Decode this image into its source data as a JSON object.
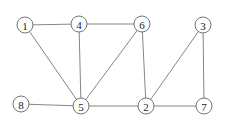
{
  "graph": {
    "nodes": [
      {
        "id": "1",
        "label": "1",
        "x": 25,
        "y": 25
      },
      {
        "id": "4",
        "label": "4",
        "x": 79,
        "y": 24
      },
      {
        "id": "6",
        "label": "6",
        "x": 142,
        "y": 24
      },
      {
        "id": "3",
        "label": "3",
        "x": 203,
        "y": 25
      },
      {
        "id": "8",
        "label": "8",
        "x": 21,
        "y": 104
      },
      {
        "id": "5",
        "label": "5",
        "x": 81,
        "y": 106
      },
      {
        "id": "2",
        "label": "2",
        "x": 146,
        "y": 106
      },
      {
        "id": "7",
        "label": "7",
        "x": 204,
        "y": 106
      }
    ],
    "edges": [
      [
        "1",
        "4"
      ],
      [
        "4",
        "6"
      ],
      [
        "1",
        "5"
      ],
      [
        "4",
        "5"
      ],
      [
        "6",
        "5"
      ],
      [
        "8",
        "5"
      ],
      [
        "5",
        "2"
      ],
      [
        "6",
        "2"
      ],
      [
        "3",
        "2"
      ],
      [
        "3",
        "7"
      ],
      [
        "2",
        "7"
      ]
    ],
    "node_radius": 8
  }
}
